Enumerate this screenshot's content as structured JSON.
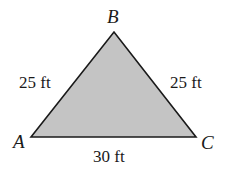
{
  "diagram": {
    "type": "triangle",
    "fill_color": "#c4c4c4",
    "stroke_color": "#1a1a1a",
    "vertices": [
      {
        "name": "A",
        "x": 31,
        "y": 137
      },
      {
        "name": "B",
        "x": 114,
        "y": 32
      },
      {
        "name": "C",
        "x": 196,
        "y": 137
      }
    ],
    "sides": {
      "AB": "25 ft",
      "BC": "25 ft",
      "AC": "30 ft"
    }
  }
}
